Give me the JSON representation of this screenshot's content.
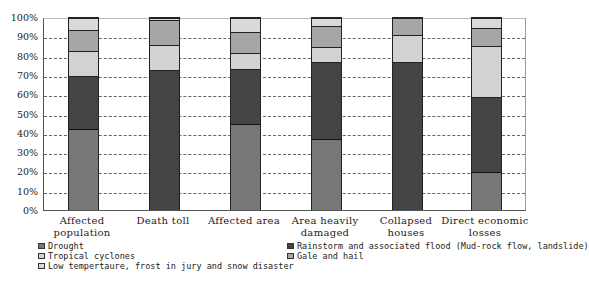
{
  "chart_data": {
    "type": "bar",
    "stacked": true,
    "normalized": true,
    "title": "",
    "xlabel": "",
    "ylabel": "",
    "ylim": [
      0,
      100
    ],
    "yticks": [
      "0%",
      "10%",
      "20%",
      "30%",
      "40%",
      "50%",
      "60%",
      "70%",
      "80%",
      "90%",
      "100%"
    ],
    "grid": "horizontal dashed",
    "legend_position": "bottom",
    "categories": [
      "Affected population",
      "Death toll",
      "Affected area",
      "Area heavily damaged",
      "Collapsed houses",
      "Direct economic losses"
    ],
    "category_lines": [
      [
        "Affected",
        "population"
      ],
      [
        "Death toll",
        ""
      ],
      [
        "Affected area",
        ""
      ],
      [
        "Area heavily",
        "damaged"
      ],
      [
        "Collapsed",
        "houses"
      ],
      [
        "Direct economic",
        "losses"
      ]
    ],
    "series": [
      {
        "name": "Drought",
        "color": "#777777",
        "values": [
          42,
          0,
          45,
          37,
          0,
          20
        ]
      },
      {
        "name": "Rainstorm and associated flood (Mud-rock flow, landslide)",
        "color": "#444444",
        "values": [
          28,
          73,
          28.5,
          40,
          77,
          39
        ]
      },
      {
        "name": "Tropical cyclones",
        "color": "#d2d2d2",
        "values": [
          13,
          13,
          8.5,
          8,
          14,
          26.5
        ]
      },
      {
        "name": "Gale and hail",
        "color": "#a6a6a6",
        "values": [
          11,
          13,
          10.5,
          11,
          9,
          9.5
        ]
      },
      {
        "name": "Low tempertaure, frost in jury and snow disaster",
        "color": "#d9d9d9",
        "values": [
          6,
          1,
          7.5,
          4,
          0,
          5
        ]
      }
    ]
  },
  "legend": {
    "items": [
      {
        "label": "Drought",
        "color": "#777777"
      },
      {
        "label": "Rainstorm and associated flood (Mud-rock flow, landslide)",
        "color": "#444444"
      },
      {
        "label": "Tropical cyclones",
        "color": "#d2d2d2"
      },
      {
        "label": "Gale and hail",
        "color": "#a6a6a6"
      },
      {
        "label": "Low tempertaure, frost in jury and snow disaster",
        "color": "#d9d9d9"
      }
    ]
  }
}
